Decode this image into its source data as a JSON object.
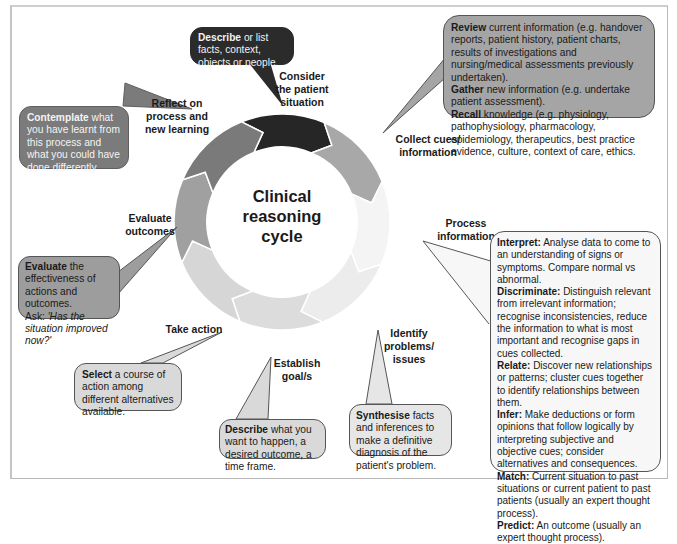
{
  "title": "Clinical reasoning cycle",
  "title_lines": [
    "Clinical",
    "reasoning",
    "cycle"
  ],
  "colors": {
    "consider": "#262626",
    "collect": "#a8a8a8",
    "process": "#f4f4f4",
    "identify": "#ececec",
    "establish": "#dcdcdc",
    "take_action": "#d6d6d6",
    "evaluate": "#a0a0a0",
    "reflect": "#7a7a7a"
  },
  "stages": [
    {
      "id": "consider",
      "label_lines": [
        "Consider",
        "the patient",
        "situation"
      ],
      "callout": [
        {
          "bold": "Describe",
          "text": " or list facts, context, objects or people."
        }
      ]
    },
    {
      "id": "collect",
      "label_lines": [
        "Collect cues/",
        "information"
      ],
      "callout": [
        {
          "bold": "Review",
          "text": " current information (e.g. handover reports, patient history, patient charts, results of investigations and nursing/medical assessments previously undertaken)."
        },
        {
          "bold": "Gather",
          "text": " new information (e.g. undertake patient assessment)."
        },
        {
          "bold": "Recall",
          "text": " knowledge (e.g. physiology, pathophysiology, pharmacology, epidemiology, therapeutics, best practice evidence, culture, context of care, ethics."
        }
      ]
    },
    {
      "id": "process",
      "label_lines": [
        "Process",
        "information"
      ],
      "callout": [
        {
          "bold": "Interpret:",
          "text": " Analyse data to come to an understanding of signs or symptoms. Compare normal vs abnormal."
        },
        {
          "bold": "Discriminate:",
          "text": " Distinguish relevant from irrelevant information; recognise inconsistencies, reduce the information to what is most important and recognise gaps in cues collected."
        },
        {
          "bold": "Relate:",
          "text": " Discover new relationships or patterns; cluster cues together to identify relationships between them."
        },
        {
          "bold": "Infer:",
          "text": " Make deductions or form opinions that follow logically by interpreting subjective and objective cues; consider alternatives and consequences."
        },
        {
          "bold": "Match:",
          "text": " Current situation to past situations or current patient to past patients (usually an expert thought process)."
        },
        {
          "bold": "Predict:",
          "text": " An outcome (usually an expert thought process)."
        }
      ]
    },
    {
      "id": "identify",
      "label_lines": [
        "Identify",
        "problems/",
        "issues"
      ],
      "callout": [
        {
          "bold": "Synthesise",
          "text": " facts and inferences to make a definitive diagnosis of the patient's problem."
        }
      ]
    },
    {
      "id": "establish",
      "label_lines": [
        "Establish",
        "goal/s"
      ],
      "callout": [
        {
          "bold": "Describe",
          "text": " what you want to happen, a desired outcome, a time frame."
        }
      ]
    },
    {
      "id": "take_action",
      "label_lines": [
        "Take action"
      ],
      "callout": [
        {
          "bold": "Select",
          "text": " a course of action among different alternatives available."
        }
      ]
    },
    {
      "id": "evaluate",
      "label_lines": [
        "Evaluate",
        "outcomes"
      ],
      "callout": [
        {
          "bold": "Evaluate",
          "text": " the effectiveness of actions and outcomes."
        },
        {
          "bold": "",
          "text": "Ask: ",
          "italic": "'Has the situation improved now?'"
        }
      ]
    },
    {
      "id": "reflect",
      "label_lines": [
        "Reflect on",
        "process and",
        "new learning"
      ],
      "callout": [
        {
          "bold": "Contemplate",
          "text": " what you have learnt from this process and what you could have done differently."
        }
      ]
    }
  ]
}
